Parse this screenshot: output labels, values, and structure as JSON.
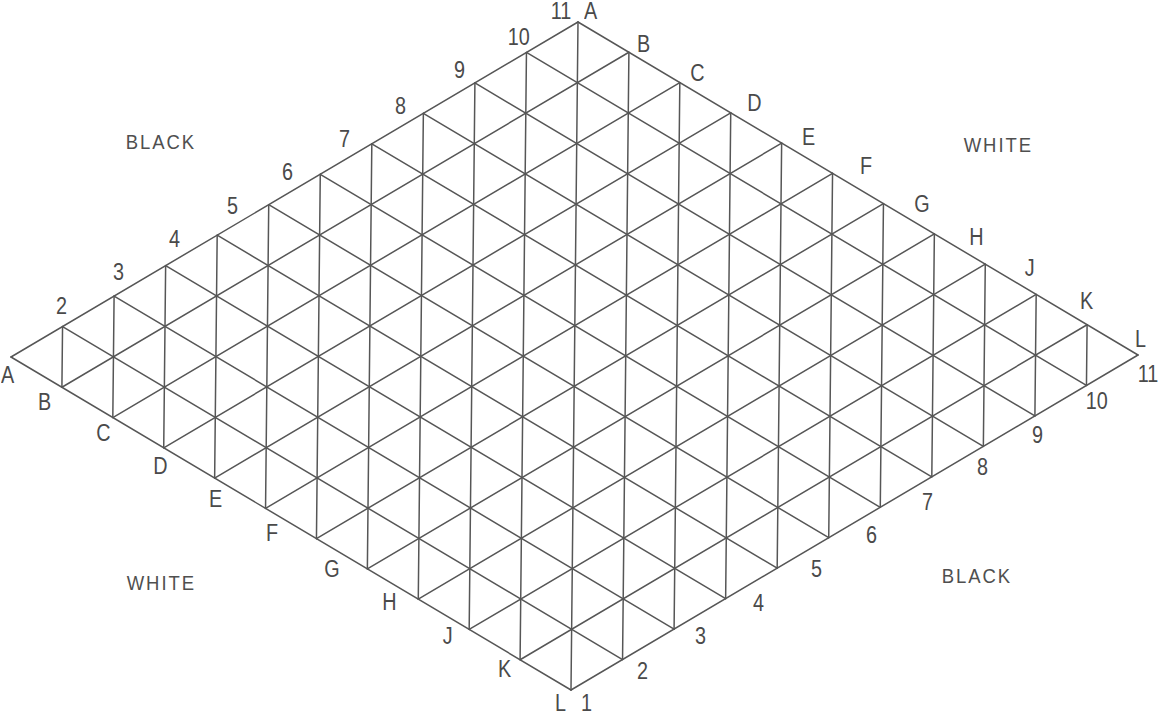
{
  "figure": {
    "background_color": "#ffffff",
    "line_color": "#565656",
    "text_color": "#4a4a4a"
  },
  "board": {
    "shape": "rhombus",
    "grid_size": 11,
    "corners": {
      "top": {
        "x": 578,
        "y": 22
      },
      "left": {
        "x": 11,
        "y": 357
      },
      "right": {
        "x": 1128,
        "y": 358
      },
      "bottom": {
        "x": 571,
        "y": 690
      }
    }
  },
  "side_labels": [
    {
      "id": "black-top-left",
      "text": "BLACK",
      "x": 121,
      "y": 131
    },
    {
      "id": "white-top-right",
      "text": "WHITE",
      "x": 959,
      "y": 134
    },
    {
      "id": "white-bottom-left",
      "text": "WHITE",
      "x": 122,
      "y": 572
    },
    {
      "id": "black-bottom-right",
      "text": "BLACK",
      "x": 937,
      "y": 565
    }
  ],
  "letter_labels_top_right": [
    {
      "text": "A",
      "x": 583,
      "y": 0
    },
    {
      "text": "B",
      "x": 636,
      "y": 33
    },
    {
      "text": "C",
      "x": 689,
      "y": 62
    },
    {
      "text": "D",
      "x": 746,
      "y": 92
    },
    {
      "text": "E",
      "x": 801,
      "y": 126
    },
    {
      "text": "F",
      "x": 859,
      "y": 155
    },
    {
      "text": "G",
      "x": 913,
      "y": 193
    },
    {
      "text": "H",
      "x": 968,
      "y": 226
    },
    {
      "text": "J",
      "x": 1024,
      "y": 257
    },
    {
      "text": "K",
      "x": 1079,
      "y": 290
    },
    {
      "text": "L",
      "x": 1134,
      "y": 328
    }
  ],
  "letter_labels_bottom_left": [
    {
      "text": "A",
      "x": 0,
      "y": 364
    },
    {
      "text": "B",
      "x": 37,
      "y": 391
    },
    {
      "text": "C",
      "x": 95,
      "y": 422
    },
    {
      "text": "D",
      "x": 152,
      "y": 455
    },
    {
      "text": "E",
      "x": 208,
      "y": 488
    },
    {
      "text": "F",
      "x": 265,
      "y": 522
    },
    {
      "text": "G",
      "x": 323,
      "y": 558
    },
    {
      "text": "H",
      "x": 381,
      "y": 591
    },
    {
      "text": "J",
      "x": 442,
      "y": 625
    },
    {
      "text": "K",
      "x": 497,
      "y": 658
    },
    {
      "text": "L",
      "x": 554,
      "y": 692
    }
  ],
  "number_labels_top_left": [
    {
      "text": "11",
      "x": 549,
      "y": 0
    },
    {
      "text": "10",
      "x": 506,
      "y": 26
    },
    {
      "text": "9",
      "x": 453,
      "y": 59
    },
    {
      "text": "8",
      "x": 394,
      "y": 95
    },
    {
      "text": "7",
      "x": 338,
      "y": 128
    },
    {
      "text": "6",
      "x": 281,
      "y": 161
    },
    {
      "text": "5",
      "x": 226,
      "y": 195
    },
    {
      "text": "4",
      "x": 168,
      "y": 228
    },
    {
      "text": "3",
      "x": 112,
      "y": 261
    },
    {
      "text": "2",
      "x": 55,
      "y": 295
    }
  ],
  "number_labels_bottom_right": [
    {
      "text": "11",
      "x": 1136,
      "y": 363
    },
    {
      "text": "10",
      "x": 1084,
      "y": 390
    },
    {
      "text": "9",
      "x": 1031,
      "y": 424
    },
    {
      "text": "8",
      "x": 976,
      "y": 456
    },
    {
      "text": "7",
      "x": 921,
      "y": 491
    },
    {
      "text": "6",
      "x": 865,
      "y": 524
    },
    {
      "text": "5",
      "x": 810,
      "y": 558
    },
    {
      "text": "4",
      "x": 752,
      "y": 592
    },
    {
      "text": "3",
      "x": 694,
      "y": 625
    },
    {
      "text": "2",
      "x": 636,
      "y": 660
    },
    {
      "text": "1",
      "x": 580,
      "y": 692
    }
  ]
}
